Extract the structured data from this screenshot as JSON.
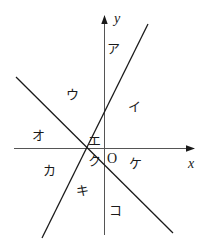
{
  "figure": {
    "width": 208,
    "height": 250,
    "background": "#ffffff",
    "stroke_color": "#1a1a1a",
    "axes": {
      "x_axis_label": "x",
      "y_axis_label": "y",
      "origin_label": "O"
    },
    "region_labels": [
      {
        "key": "a",
        "text": "ア",
        "x": 107,
        "y": 42
      },
      {
        "key": "i",
        "text": "イ",
        "x": 128,
        "y": 100
      },
      {
        "key": "u",
        "text": "ウ",
        "x": 66,
        "y": 88
      },
      {
        "key": "e",
        "text": "エ",
        "x": 88,
        "y": 134
      },
      {
        "key": "o",
        "text": "オ",
        "x": 32,
        "y": 129
      },
      {
        "key": "ka",
        "text": "カ",
        "x": 43,
        "y": 164
      },
      {
        "key": "ki",
        "text": "キ",
        "x": 76,
        "y": 184
      },
      {
        "key": "ku",
        "text": "ク",
        "x": 88,
        "y": 154
      },
      {
        "key": "ke",
        "text": "ケ",
        "x": 129,
        "y": 157
      },
      {
        "key": "ko",
        "text": "コ",
        "x": 109,
        "y": 204
      }
    ],
    "lines": [
      {
        "key": "ascending_line",
        "x1": 42,
        "y1": 238,
        "x2": 148,
        "y2": 24
      },
      {
        "key": "descending_line",
        "x1": 16,
        "y1": 77,
        "x2": 173,
        "y2": 233
      }
    ],
    "x_axis": {
      "x1": 14,
      "y1": 148,
      "x2": 196,
      "y2": 148
    },
    "y_axis": {
      "x1": 104,
      "y1": 235,
      "x2": 104,
      "y2": 14
    },
    "x_label_pos": {
      "x": 188,
      "y": 158
    },
    "y_label_pos": {
      "x": 114,
      "y": 13
    },
    "origin_label_pos": {
      "x": 107,
      "y": 152
    }
  }
}
